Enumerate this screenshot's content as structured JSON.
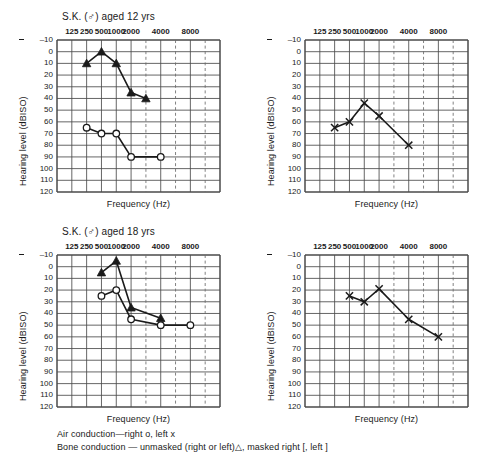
{
  "page": {
    "legend": {
      "line1_pre": "Air conduction",
      "line1_dash": "—",
      "line1_post": "right o, left x",
      "line2_pre": "Bone conduction",
      "line2_dash": "—",
      "line2_post_a": "unmasked (right or left)",
      "line2_tri": "△",
      "line2_post_b": ", masked right [, left ]"
    }
  },
  "axis": {
    "ylabel": "Hearing level (dBISO)",
    "xlabel": "Frequency (Hz)",
    "yticks": [
      "–10",
      "0",
      "10",
      "20",
      "30",
      "40",
      "50",
      "60",
      "70",
      "80",
      "90",
      "100",
      "110",
      "120"
    ],
    "xticks": [
      "125",
      "250",
      "500",
      "1000",
      "2000",
      "4000",
      "8000"
    ],
    "ylim": [
      -10,
      120
    ],
    "ystep": 10
  },
  "colors": {
    "ink": "#1a1a1a",
    "grid": "#4a4a4a",
    "dashed": "#6b6b6b",
    "paper": "#ffffff"
  },
  "chart_data": [
    {
      "id": "top-left",
      "type": "line",
      "title_name": "S.K. (",
      "title_sex": "♂",
      "title_rest": ") aged 12 yrs",
      "title": "S.K. (♂) aged 12 yrs",
      "ear": "right",
      "xlabel": "Frequency (Hz)",
      "ylabel": "Hearing level (dBISO)",
      "ylim": [
        -10,
        120
      ],
      "grid": true,
      "legend_position": "none",
      "series": [
        {
          "name": "Bone conduction (unmasked)",
          "marker": "filled-triangle",
          "x": [
            250,
            500,
            1000,
            2000,
            3000
          ],
          "xticklabels": [
            "250",
            "500",
            "1000",
            "2000",
            "3000"
          ],
          "values": [
            10,
            0,
            10,
            35,
            40
          ]
        },
        {
          "name": "Air conduction right",
          "marker": "circle",
          "x": [
            250,
            500,
            1000,
            2000,
            4000
          ],
          "xticklabels": [
            "250",
            "500",
            "1000",
            "2000",
            "4000"
          ],
          "values": [
            65,
            70,
            70,
            90,
            90
          ]
        }
      ]
    },
    {
      "id": "top-right",
      "type": "line",
      "title": "",
      "ear": "left",
      "xlabel": "Frequency (Hz)",
      "ylabel": "Hearing level (dBISO)",
      "ylim": [
        -10,
        120
      ],
      "grid": true,
      "legend_position": "none",
      "series": [
        {
          "name": "Air conduction left",
          "marker": "cross",
          "x": [
            250,
            500,
            1000,
            2000,
            4000
          ],
          "xticklabels": [
            "250",
            "500",
            "1000",
            "2000",
            "4000"
          ],
          "values": [
            65,
            60,
            44,
            55,
            80
          ]
        }
      ]
    },
    {
      "id": "bottom-left",
      "type": "line",
      "title_name": "S.K. (",
      "title_sex": "♂",
      "title_rest": ") aged 18 yrs",
      "title": "S.K. (♂) aged 18 yrs",
      "ear": "right",
      "xlabel": "Frequency (Hz)",
      "ylabel": "Hearing level (dBISO)",
      "ylim": [
        -10,
        120
      ],
      "grid": true,
      "legend_position": "none",
      "series": [
        {
          "name": "Bone conduction (unmasked)",
          "marker": "filled-triangle",
          "x": [
            500,
            1000,
            2000,
            4000
          ],
          "xticklabels": [
            "500",
            "1000",
            "2000",
            "4000"
          ],
          "values": [
            5,
            -5,
            35,
            44
          ]
        },
        {
          "name": "Air conduction right",
          "marker": "circle",
          "x": [
            500,
            1000,
            2000,
            4000,
            8000
          ],
          "xticklabels": [
            "500",
            "1000",
            "2000",
            "4000",
            "8000"
          ],
          "values": [
            25,
            20,
            45,
            50,
            50
          ]
        }
      ]
    },
    {
      "id": "bottom-right",
      "type": "line",
      "title": "",
      "ear": "left",
      "xlabel": "Frequency (Hz)",
      "ylabel": "Hearing level (dBISO)",
      "ylim": [
        -10,
        120
      ],
      "grid": true,
      "legend_position": "none",
      "series": [
        {
          "name": "Air conduction left",
          "marker": "cross",
          "x": [
            500,
            1000,
            2000,
            4000,
            8000
          ],
          "xticklabels": [
            "500",
            "1000",
            "2000",
            "4000",
            "8000"
          ],
          "values": [
            25,
            30,
            19,
            45,
            60
          ]
        }
      ]
    }
  ]
}
